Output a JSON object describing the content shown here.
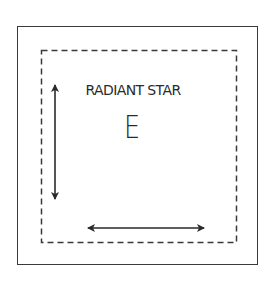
{
  "diagram": {
    "title": "RADIANT STAR",
    "letter": "E",
    "elements": {
      "outer_border": "solid",
      "inner_border": "dashed",
      "vertical_arrow": "double-headed",
      "horizontal_arrow": "double-headed"
    },
    "colors": {
      "stroke": "#2a2a2a",
      "background": "#ffffff"
    }
  }
}
